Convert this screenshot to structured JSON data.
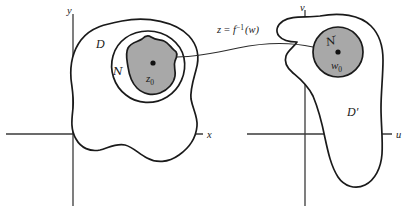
{
  "figure": {
    "background_color": "#ffffff",
    "outline_color": "#1a1a1a",
    "fill_color": "#a8a8a8",
    "axis_color": "#3a3a3a"
  },
  "z_plane": {
    "axis_vertical_label": "y",
    "axis_horizontal_label": "x",
    "domain_label": "D",
    "neighborhood_label": "ℕ",
    "neighborhood_script": "N",
    "point_label": "z",
    "point_subscript": "0"
  },
  "w_plane": {
    "axis_vertical_label": "v",
    "axis_horizontal_label": "u",
    "domain_label": "D′",
    "neighborhood_script": "N",
    "neighborhood_prime": "′",
    "point_label": "w",
    "point_subscript": "0"
  },
  "mapping": {
    "label_lhs": "z",
    "label_eq": "=",
    "label_fn": "f",
    "label_exp": "−1",
    "label_arg": "(w)",
    "full_label": "z = f⁻¹(w)"
  }
}
